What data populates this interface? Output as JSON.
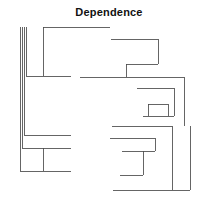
{
  "chart_data": {
    "type": "dendrogram",
    "title": "Dependence",
    "orientation": "horizontal",
    "subtitle": "",
    "xlabel": "",
    "ylabel": "",
    "grid": false,
    "legend": "none",
    "axis_visible": false,
    "tick_labels": [],
    "leaf_labels": [],
    "line_color": "#4a4a4a",
    "line_width": 0.85,
    "background": "#ffffff",
    "xlim": [
      0,
      218
    ],
    "ylim": [
      0,
      197
    ],
    "clusters": [
      {
        "name": "left-cluster",
        "leaf_count": 6,
        "merges": [
          {
            "id": "L1",
            "x_leaf": 26,
            "x_merge": 43,
            "y_top": 27,
            "y_bottom": 76
          },
          {
            "id": "L2",
            "x_leaf": 24,
            "x_merge": 43,
            "y_top": 27,
            "y_bottom": 135
          },
          {
            "id": "L3",
            "x_leaf": 22,
            "x_merge": 43,
            "y_top": 27,
            "y_bottom": 148
          },
          {
            "id": "L4",
            "x_leaf": 20,
            "x_merge": 43,
            "y_top": 27,
            "y_bottom": 171
          }
        ]
      },
      {
        "name": "right-cluster",
        "leaf_count": 11,
        "merges": [
          {
            "id": "R1",
            "x_leaf": 111,
            "x_merge": 158,
            "y_top": 39,
            "y_bottom": 64
          },
          {
            "id": "R2",
            "x_leaf": 126,
            "x_merge": 158,
            "y_top": 64,
            "y_bottom": 77
          },
          {
            "id": "R3",
            "x_leaf": 80,
            "x_merge": 184,
            "y_top": 77,
            "y_bottom": 126
          },
          {
            "id": "R4",
            "x_leaf": 137,
            "x_merge": 174,
            "y_top": 88,
            "y_bottom": 116
          },
          {
            "id": "R5",
            "x_leaf": 148,
            "x_merge": 168,
            "y_top": 104,
            "y_bottom": 116
          },
          {
            "id": "R6",
            "x_leaf": 112,
            "x_merge": 172,
            "y_top": 126,
            "y_bottom": 190
          },
          {
            "id": "R7",
            "x_leaf": 110,
            "x_merge": 155,
            "y_top": 138,
            "y_bottom": 151
          },
          {
            "id": "R8",
            "x_leaf": 122,
            "x_merge": 143,
            "y_top": 151,
            "y_bottom": 175
          },
          {
            "id": "R9",
            "x_leaf": 113,
            "x_merge": 190,
            "y_top": 190,
            "y_bottom": 190
          }
        ]
      }
    ],
    "paths": [
      "M43,27 H110",
      "M43,27 V76",
      "M26,27 V76",
      "M26,76 H43",
      "M43,76 H71",
      "M24,27 V135",
      "M24,135 H71",
      "M22,27 V148",
      "M22,148 H71",
      "M20,27 V171",
      "M20,171 H43",
      "M43,148 V171",
      "M43,171 H71",
      "M111,39 H158",
      "M158,39 V64",
      "M126,64 H158",
      "M126,64 V77",
      "M80,77 H184",
      "M184,77 V126",
      "M137,88 H174",
      "M174,88 V116",
      "M148,104 H168",
      "M168,104 V116",
      "M148,104 V116",
      "M143,116 H174",
      "M112,126 H172",
      "M172,126 V190",
      "M110,138 H155",
      "M155,138 V151",
      "M122,151 H155",
      "M143,151 V175",
      "M120,175 H143",
      "M113,190 H190",
      "M190,126 V190"
    ]
  },
  "title": {
    "text": "Dependence"
  }
}
